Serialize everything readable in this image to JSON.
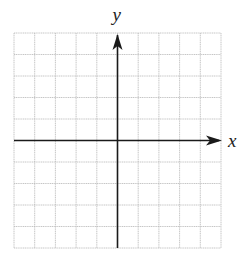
{
  "diagram": {
    "type": "coordinate-plane",
    "axes": {
      "x_label": "x",
      "y_label": "y"
    },
    "grid": {
      "columns": 10,
      "rows": 10,
      "left": 14,
      "right": 221,
      "top": 33,
      "bottom": 248,
      "origin_col": 5,
      "origin_row": 5,
      "grid_color": "#b8b8b8",
      "axis_color": "#1a1a1a"
    }
  }
}
